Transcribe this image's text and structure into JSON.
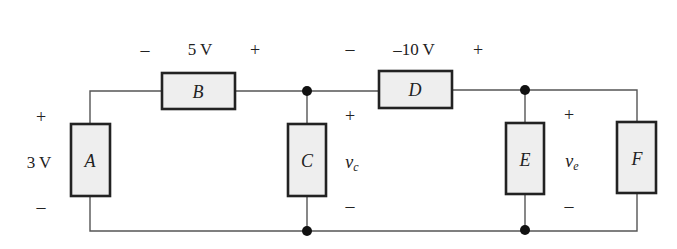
{
  "diagram": {
    "type": "circuit",
    "components": [
      {
        "id": "A",
        "label": "A",
        "voltage_label": "3 V",
        "plus": "+",
        "minus": "–"
      },
      {
        "id": "B",
        "label": "B",
        "voltage_label": "5 V",
        "plus": "+",
        "minus": "–"
      },
      {
        "id": "C",
        "label": "C",
        "voltage_var": "v",
        "voltage_sub": "c",
        "plus": "+",
        "minus": "–"
      },
      {
        "id": "D",
        "label": "D",
        "voltage_label": "–10 V",
        "plus": "+",
        "minus": "–"
      },
      {
        "id": "E",
        "label": "E",
        "voltage_var": "v",
        "voltage_sub": "e",
        "plus": "+",
        "minus": "–"
      },
      {
        "id": "F",
        "label": "F"
      }
    ],
    "colors": {
      "wire": "#555555",
      "box_fill": "#eeeeee",
      "box_stroke": "#222222",
      "node": "#111111"
    }
  }
}
